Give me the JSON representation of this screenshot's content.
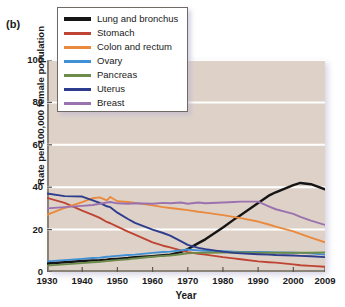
{
  "figure": {
    "panel_label": "(b)",
    "plot_background_color": "#ded2c8",
    "gridline_color": "#ffffff",
    "axis_color": "#8a8378"
  },
  "legend": {
    "position": "top-left-inside",
    "entries": [
      {
        "label": "Lung and bronchus",
        "color": "#151515"
      },
      {
        "label": "Stomach",
        "color": "#bf4433"
      },
      {
        "label": "Colon and rectum",
        "color": "#e98a3e"
      },
      {
        "label": "Ovary",
        "color": "#3f90d4"
      },
      {
        "label": "Pancreas",
        "color": "#6d8b4b"
      },
      {
        "label": "Uterus",
        "color": "#2d3c8c"
      },
      {
        "label": "Breast",
        "color": "#9b72b0"
      }
    ]
  },
  "chart_data": {
    "type": "line",
    "title": "",
    "xlabel": "Year",
    "ylabel": "Rate per 100,000 female population",
    "xlim": [
      1930,
      2009
    ],
    "ylim": [
      0,
      100
    ],
    "xticks": [
      1930,
      1940,
      1950,
      1960,
      1970,
      1980,
      1990,
      2000,
      2009
    ],
    "yticks": [
      0,
      20,
      40,
      60,
      80,
      100
    ],
    "grid": "horizontal",
    "x": [
      1930,
      1935,
      1940,
      1943,
      1945,
      1947,
      1948,
      1950,
      1953,
      1955,
      1960,
      1963,
      1965,
      1968,
      1970,
      1973,
      1975,
      1980,
      1983,
      1985,
      1990,
      1993,
      1995,
      2000,
      2002,
      2005,
      2009
    ],
    "series": [
      {
        "name": "Lung and bronchus",
        "color": "#151515",
        "values": [
          4.0,
          4.6,
          5.2,
          5.5,
          5.6,
          5.8,
          6.0,
          6.2,
          6.6,
          7.0,
          7.5,
          7.9,
          8.2,
          9.4,
          10.8,
          13.6,
          15.4,
          21.0,
          24.6,
          26.8,
          32.5,
          36.0,
          37.6,
          41.0,
          42.0,
          41.4,
          39.0
        ]
      },
      {
        "name": "Stomach",
        "color": "#bf4433",
        "values": [
          35.0,
          32.6,
          29.0,
          27.0,
          25.5,
          23.6,
          23.0,
          21.4,
          19.0,
          17.6,
          14.0,
          12.4,
          11.6,
          10.2,
          9.4,
          8.6,
          8.2,
          7.0,
          6.4,
          6.0,
          5.0,
          4.6,
          4.4,
          3.6,
          3.2,
          2.9,
          2.5
        ]
      },
      {
        "name": "Colon and rectum",
        "color": "#e98a3e",
        "values": [
          27.0,
          30.2,
          33.0,
          34.8,
          35.2,
          33.8,
          35.4,
          33.4,
          33.0,
          32.6,
          31.4,
          30.6,
          30.2,
          29.6,
          29.2,
          28.4,
          28.0,
          26.8,
          26.0,
          25.4,
          23.8,
          22.4,
          21.4,
          19.2,
          18.0,
          16.2,
          14.0
        ]
      },
      {
        "name": "Ovary",
        "color": "#3f90d4",
        "values": [
          5.0,
          5.6,
          6.2,
          6.6,
          6.8,
          7.2,
          7.3,
          7.6,
          8.0,
          8.2,
          9.0,
          9.4,
          9.6,
          10.2,
          10.6,
          10.2,
          10.0,
          9.8,
          9.6,
          9.5,
          9.4,
          9.3,
          9.2,
          9.1,
          9.0,
          8.8,
          8.2
        ]
      },
      {
        "name": "Pancreas",
        "color": "#6d8b4b",
        "values": [
          3.0,
          3.6,
          4.2,
          4.6,
          4.8,
          5.2,
          5.3,
          5.6,
          6.0,
          6.4,
          7.2,
          7.6,
          7.8,
          8.4,
          8.8,
          9.0,
          9.1,
          9.2,
          9.2,
          9.2,
          9.1,
          9.1,
          9.1,
          9.1,
          9.1,
          9.1,
          9.2
        ]
      },
      {
        "name": "Uterus",
        "color": "#2d3c8c",
        "values": [
          37.0,
          35.8,
          35.6,
          33.8,
          32.6,
          31.0,
          30.6,
          28.0,
          25.0,
          23.2,
          20.0,
          18.4,
          17.2,
          14.6,
          12.8,
          11.4,
          10.8,
          9.6,
          9.0,
          8.8,
          8.4,
          8.2,
          8.0,
          7.8,
          7.6,
          7.4,
          7.0
        ]
      },
      {
        "name": "Breast",
        "color": "#9b72b0",
        "values": [
          30.0,
          30.6,
          31.2,
          31.6,
          32.2,
          32.8,
          33.0,
          32.4,
          32.2,
          32.4,
          32.2,
          32.6,
          32.4,
          32.8,
          32.2,
          32.8,
          32.4,
          32.8,
          33.0,
          33.2,
          33.2,
          31.0,
          29.6,
          27.4,
          26.0,
          24.2,
          22.2
        ]
      }
    ]
  }
}
